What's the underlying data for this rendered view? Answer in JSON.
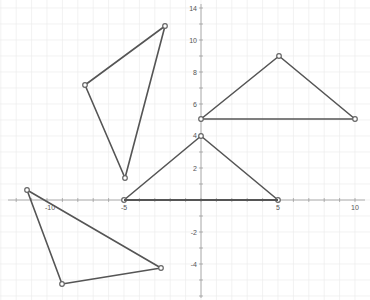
{
  "figure": {
    "type": "coordinate-plane",
    "x_axis": {
      "ticks": [
        -10,
        -5,
        5,
        10
      ],
      "labels": [
        "-10",
        "-5",
        "5",
        "10"
      ]
    },
    "y_axis": {
      "ticks": [
        14,
        10,
        8,
        6,
        4,
        2,
        -2,
        -4
      ],
      "labels": [
        "14",
        "10",
        "8",
        "6",
        "4",
        "2",
        "-2",
        "-4"
      ]
    },
    "colors": {
      "grid": "#ececec",
      "axis": "#9a9a9a",
      "shape": "#555555",
      "vertex": "#666666"
    },
    "triangles": [
      {
        "name": "triangle-upper-left",
        "vertices_px": [
          [
            85,
            85
          ],
          [
            165,
            26
          ],
          [
            125,
            178
          ]
        ]
      },
      {
        "name": "triangle-upper-right",
        "vertices_px": [
          [
            201,
            119
          ],
          [
            279,
            56
          ],
          [
            355,
            119
          ]
        ]
      },
      {
        "name": "triangle-center",
        "vertices_px": [
          [
            124,
            200
          ],
          [
            201,
            136
          ],
          [
            278,
            200
          ]
        ]
      },
      {
        "name": "triangle-lower-left",
        "vertices_px": [
          [
            27,
            190
          ],
          [
            62,
            284
          ],
          [
            161,
            268
          ]
        ]
      }
    ]
  }
}
